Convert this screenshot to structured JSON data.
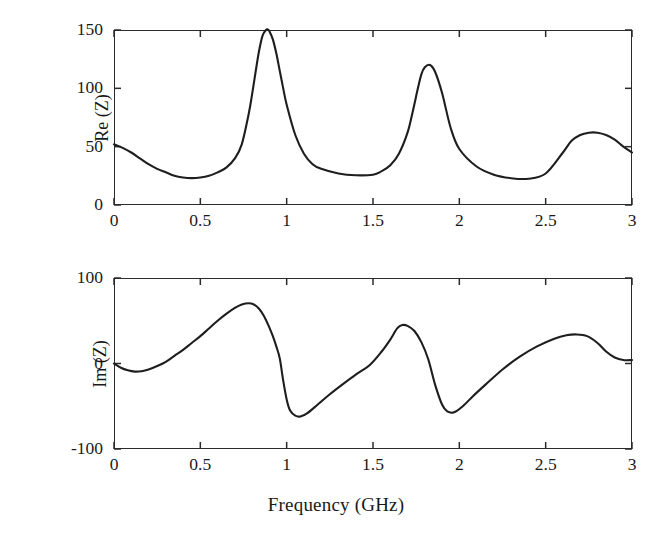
{
  "figure": {
    "background_color": "#ffffff",
    "line_color": "#1e1e1e",
    "axis_color": "#2b2b2b",
    "xlabel": "Frequency (GHz)"
  },
  "chart_data": [
    {
      "type": "line",
      "panel": "top",
      "title": "",
      "xlabel": "",
      "ylabel": "Re (Z)",
      "xlim": [
        0,
        3
      ],
      "ylim": [
        0,
        150
      ],
      "xticks": [
        0,
        0.5,
        1,
        1.5,
        2,
        2.5,
        3
      ],
      "xticklabels": [
        "0",
        "0.5",
        "1",
        "1.5",
        "2",
        "2.5",
        "3"
      ],
      "yticks": [
        0,
        50,
        100,
        150
      ],
      "yticklabels": [
        "0",
        "50",
        "100",
        "150"
      ],
      "grid": false,
      "legend": null,
      "series": [
        {
          "name": "Re(Z)",
          "x": [
            0,
            0.05,
            0.1,
            0.15,
            0.2,
            0.25,
            0.3,
            0.35,
            0.4,
            0.45,
            0.5,
            0.55,
            0.6,
            0.65,
            0.7,
            0.74,
            0.78,
            0.8,
            0.82,
            0.84,
            0.86,
            0.88,
            0.89,
            0.9,
            0.92,
            0.94,
            0.96,
            0.98,
            1.0,
            1.05,
            1.1,
            1.15,
            1.2,
            1.3,
            1.4,
            1.5,
            1.55,
            1.6,
            1.65,
            1.7,
            1.73,
            1.76,
            1.78,
            1.8,
            1.83,
            1.86,
            1.9,
            1.95,
            2.0,
            2.1,
            2.2,
            2.3,
            2.4,
            2.5,
            2.6,
            2.65,
            2.7,
            2.75,
            2.8,
            2.85,
            2.9,
            2.95,
            3.0
          ],
          "y": [
            52,
            49,
            45,
            40,
            35,
            31,
            28,
            25,
            23.5,
            23,
            23.5,
            25,
            28,
            32,
            40,
            52,
            78,
            95,
            114,
            132,
            145,
            150,
            150.5,
            149,
            142,
            130,
            115,
            100,
            86,
            60,
            44,
            35,
            31,
            27,
            25.5,
            26,
            29,
            34,
            44,
            62,
            80,
            100,
            112,
            118,
            120,
            114,
            96,
            66,
            48,
            33,
            26,
            23,
            22.5,
            27,
            45,
            55,
            60,
            62,
            62,
            60,
            56,
            50,
            45
          ]
        }
      ]
    },
    {
      "type": "line",
      "panel": "bottom",
      "title": "",
      "xlabel": "Frequency (GHz)",
      "ylabel": "Im (Z)",
      "xlim": [
        0,
        3
      ],
      "ylim": [
        -100,
        100
      ],
      "xticks": [
        0,
        0.5,
        1,
        1.5,
        2,
        2.5,
        3
      ],
      "xticklabels": [
        "0",
        "0.5",
        "1",
        "1.5",
        "2",
        "2.5",
        "3"
      ],
      "yticks": [
        -100,
        0,
        100
      ],
      "yticklabels": [
        "-100",
        "0",
        "100"
      ],
      "grid": false,
      "legend": null,
      "series": [
        {
          "name": "Im(Z)",
          "x": [
            0,
            0.04,
            0.08,
            0.12,
            0.16,
            0.2,
            0.25,
            0.3,
            0.35,
            0.4,
            0.45,
            0.5,
            0.55,
            0.6,
            0.65,
            0.7,
            0.74,
            0.78,
            0.81,
            0.84,
            0.87,
            0.9,
            0.92,
            0.94,
            0.96,
            0.98,
            1.0,
            1.02,
            1.05,
            1.08,
            1.12,
            1.18,
            1.25,
            1.32,
            1.4,
            1.48,
            1.55,
            1.6,
            1.64,
            1.67,
            1.7,
            1.74,
            1.78,
            1.82,
            1.86,
            1.9,
            1.93,
            1.97,
            2.02,
            2.08,
            2.15,
            2.25,
            2.35,
            2.45,
            2.55,
            2.62,
            2.68,
            2.74,
            2.8,
            2.85,
            2.9,
            2.95,
            3.0
          ],
          "y": [
            0,
            -5,
            -8,
            -9.5,
            -9,
            -7,
            -3,
            2,
            9,
            16,
            24,
            32,
            41,
            50,
            58,
            65,
            69,
            70.5,
            69,
            64,
            55,
            42,
            32,
            20,
            6,
            -20,
            -42,
            -55,
            -61,
            -62,
            -58,
            -48,
            -36,
            -25,
            -13,
            -2,
            14,
            28,
            41,
            45,
            44,
            38,
            25,
            5,
            -25,
            -48,
            -56,
            -57,
            -50,
            -38,
            -25,
            -7,
            8,
            20,
            29,
            33,
            34,
            32,
            24,
            14,
            7,
            4,
            4
          ]
        }
      ]
    }
  ]
}
